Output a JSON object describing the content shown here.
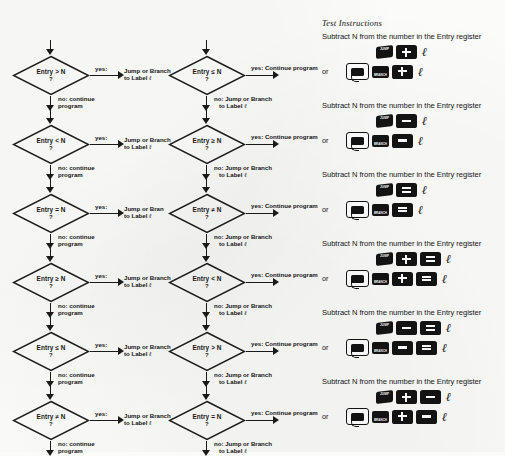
{
  "page": {
    "background": "#fbfbfa",
    "ink": "#151515"
  },
  "flowcharts": {
    "left_column": {
      "yes_tag": "yes:",
      "no_tag": "no: continue",
      "no_tag_line2": "program",
      "target_line1": "Jump or Branch",
      "target_line2": "to Label",
      "label_symbol": "ℓ",
      "nodes": [
        {
          "condition": "Entry > N",
          "question": "?",
          "target_line1": "Jump or Branch"
        },
        {
          "condition": "Entry < N",
          "question": "?",
          "target_line1": "Jump or Branch"
        },
        {
          "condition": "Entry = N",
          "question": "?",
          "target_line1": "Jump or Bran"
        },
        {
          "condition": "Entry ≥ N",
          "question": "?",
          "target_line1": "Jump or Branch"
        },
        {
          "condition": "Entry ≤ N",
          "question": "?",
          "target_line1": "Jump or Branch"
        },
        {
          "condition": "Entry ≠ N",
          "question": "?",
          "target_line1": "Jump or Branch"
        }
      ]
    },
    "mid_column": {
      "yes_tag": "yes: Continue program",
      "no_tag_line1": "no: Jump or Branch",
      "no_tag_line2": "to Label",
      "label_symbol": "ℓ",
      "nodes": [
        {
          "condition": "Entry ≤ N",
          "question": "?"
        },
        {
          "condition": "Entry ≥ N",
          "question": "?"
        },
        {
          "condition": "Entry ≠ N",
          "question": "?"
        },
        {
          "condition": "Entry < N",
          "question": "?"
        },
        {
          "condition": "Entry > N",
          "question": "?"
        },
        {
          "condition": "Entry = N",
          "question": "?"
        }
      ]
    }
  },
  "test_instructions": {
    "heading": "Test Instructions",
    "or_label": "or",
    "jump_key_label": "JUMP",
    "branch_key_label": "BRANCH",
    "label_symbol": "ℓ",
    "blocks": [
      {
        "text": "Subtract N from the number in the Entry register",
        "row1_keys": [
          "jump",
          "plus"
        ],
        "row2_keys": [
          "shift",
          "branch",
          "plus"
        ]
      },
      {
        "text": "Subtract N from the number in the Entry register",
        "row1_keys": [
          "jump",
          "minus"
        ],
        "row2_keys": [
          "shift",
          "branch",
          "minus"
        ]
      },
      {
        "text": "Subtract N from the number in the Entry register",
        "row1_keys": [
          "jump",
          "equals"
        ],
        "row2_keys": [
          "shift",
          "branch",
          "equals"
        ]
      },
      {
        "text": "Subtract N from the number in the Entry register",
        "row1_keys": [
          "jump",
          "plus",
          "equals"
        ],
        "row2_keys": [
          "shift",
          "branch",
          "plus",
          "equals"
        ]
      },
      {
        "text": "Subtract N from the number in the Entry register",
        "row1_keys": [
          "jump",
          "minus",
          "equals"
        ],
        "row2_keys": [
          "shift",
          "branch",
          "minus",
          "equals"
        ]
      },
      {
        "text": "Subtract N from the number in the Entry register",
        "row1_keys": [
          "jump",
          "plus",
          "minus"
        ],
        "row2_keys": [
          "shift",
          "branch",
          "plus",
          "minus"
        ]
      }
    ]
  }
}
